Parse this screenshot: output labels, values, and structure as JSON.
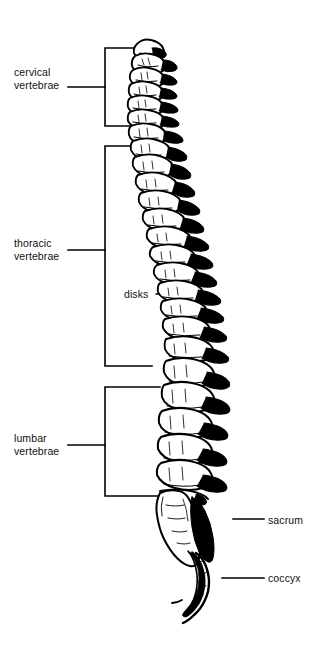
{
  "figure": {
    "background_color": "#ffffff",
    "ink_color": "#000000",
    "view": "lateral (side) view, anterior to the left"
  },
  "labels": {
    "cervical": {
      "line1": "cervical",
      "line2": "vertebrae"
    },
    "thoracic": {
      "line1": "thoracic",
      "line2": "vertebrae"
    },
    "lumbar": {
      "line1": "lumbar",
      "line2": "vertebrae"
    },
    "disks": {
      "text": "disks"
    },
    "sacrum": {
      "text": "sacrum"
    },
    "coccyx": {
      "text": "coccyx"
    }
  },
  "regions": [
    {
      "name": "cervical vertebrae",
      "bracket_top": 48,
      "bracket_bottom": 126,
      "count": 7
    },
    {
      "name": "thoracic vertebrae",
      "bracket_top": 146,
      "bracket_bottom": 366,
      "count": 12
    },
    {
      "name": "lumbar vertebrae",
      "bracket_top": 387,
      "bracket_bottom": 496,
      "count": 5
    },
    {
      "name": "sacrum",
      "bracket_top": null,
      "bracket_bottom": null,
      "count": 1
    },
    {
      "name": "coccyx",
      "bracket_top": null,
      "bracket_bottom": null,
      "count": 1
    }
  ],
  "leaders": {
    "disks_prongs": 3,
    "disks_origin_x": 160,
    "disks_origin_y": 294
  }
}
